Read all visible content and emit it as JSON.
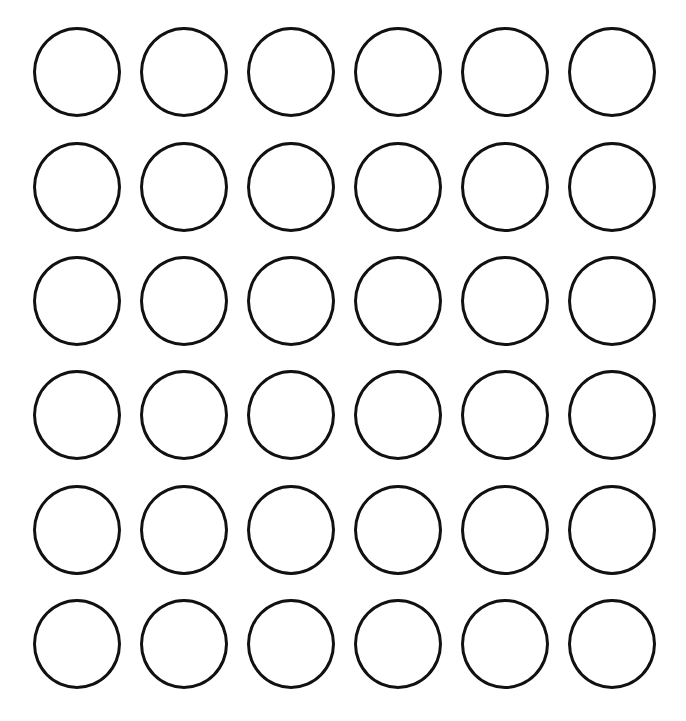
{
  "page": {
    "title_fragment": "",
    "stroke_color": "#111111",
    "background_color": "#ffffff"
  },
  "grid": {
    "rows": 6,
    "columns": 6,
    "column_centers_px": [
      77,
      184,
      291,
      398,
      505,
      612
    ],
    "row_centers_px": [
      71,
      186,
      300,
      414,
      529,
      643
    ],
    "circle_diameter_px": 88,
    "circle_style": "outline"
  }
}
